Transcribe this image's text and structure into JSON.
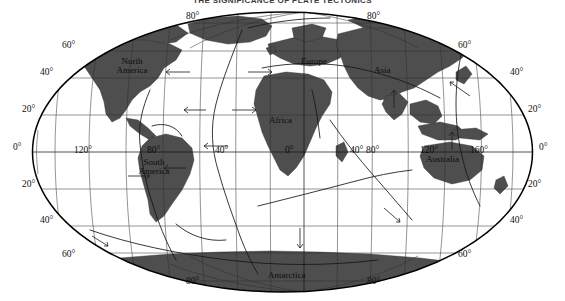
{
  "title": "THE SIGNIFICANCE OF PLATE TECTONICS",
  "map": {
    "projection": "mollweide",
    "type": "world-map",
    "colors": {
      "land": "#4a4a4a",
      "ocean": "#ffffff",
      "graticule": "#2b2b2b",
      "outline": "#000000",
      "plate_boundary": "#1a1a1a",
      "text": "#111111"
    },
    "latitude_labels_left": [
      {
        "text": "60°",
        "value": 60
      },
      {
        "text": "40°",
        "value": 40
      },
      {
        "text": "20°",
        "value": 20
      },
      {
        "text": "0°",
        "value": 0
      },
      {
        "text": "20°",
        "value": -20
      },
      {
        "text": "40°",
        "value": -40
      },
      {
        "text": "60°",
        "value": -60
      }
    ],
    "latitude_labels_right": [
      {
        "text": "60°",
        "value": 60
      },
      {
        "text": "40°",
        "value": 40
      },
      {
        "text": "20°",
        "value": 20
      },
      {
        "text": "0°",
        "value": 0
      },
      {
        "text": "20°",
        "value": -20
      },
      {
        "text": "40°",
        "value": -40
      },
      {
        "text": "60°",
        "value": -60
      }
    ],
    "polar_labels": [
      {
        "text": "80°",
        "position": "top-left"
      },
      {
        "text": "80°",
        "position": "top-right"
      },
      {
        "text": "80°",
        "position": "bottom-left"
      },
      {
        "text": "80°",
        "position": "bottom-right"
      }
    ],
    "longitude_labels": [
      {
        "text": "120°",
        "value": -120
      },
      {
        "text": "80°",
        "value": -80
      },
      {
        "text": "40°",
        "value": -40
      },
      {
        "text": "0°",
        "value": 0
      },
      {
        "text": "40°",
        "value": 40
      },
      {
        "text": "80°",
        "value": 80
      },
      {
        "text": "120°",
        "value": 120
      },
      {
        "text": "160°",
        "value": 160
      }
    ],
    "continents": [
      {
        "name": "north-america",
        "line1": "North",
        "line2": "America"
      },
      {
        "name": "south-america",
        "line1": "South",
        "line2": "America"
      },
      {
        "name": "europe",
        "line1": "Europe",
        "line2": ""
      },
      {
        "name": "africa",
        "line1": "Africa",
        "line2": ""
      },
      {
        "name": "asia",
        "line1": "Asia",
        "line2": ""
      },
      {
        "name": "australia",
        "line1": "Australia",
        "line2": ""
      },
      {
        "name": "antarctica",
        "line1": "Antarctica",
        "line2": ""
      }
    ]
  }
}
